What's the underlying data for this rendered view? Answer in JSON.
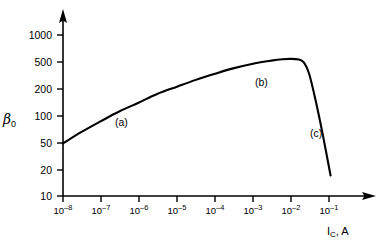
{
  "chart_data": {
    "type": "line",
    "title": "",
    "xlabel": "I_C, A",
    "xlabel_main": "I",
    "xlabel_sub": "C",
    "xlabel_suffix": ", A",
    "ylabel": "β₀",
    "ylabel_main": "β",
    "ylabel_sub": "0",
    "xscale": "log",
    "yscale": "log",
    "xlim": [
      1e-08,
      0.2
    ],
    "ylim": [
      10,
      2000
    ],
    "grid": false,
    "legend": "none",
    "xticks": [
      {
        "value": 1e-08,
        "label_base": "10",
        "label_exp": "–8"
      },
      {
        "value": 1e-07,
        "label_base": "10",
        "label_exp": "–7"
      },
      {
        "value": 1e-06,
        "label_base": "10",
        "label_exp": "–6"
      },
      {
        "value": 1e-05,
        "label_base": "10",
        "label_exp": "–5"
      },
      {
        "value": 0.0001,
        "label_base": "10",
        "label_exp": "–4"
      },
      {
        "value": 0.001,
        "label_base": "10",
        "label_exp": "–3"
      },
      {
        "value": 0.01,
        "label_base": "10",
        "label_exp": "–2"
      },
      {
        "value": 0.1,
        "label_base": "10",
        "label_exp": "–1"
      }
    ],
    "yticks": [
      {
        "value": 1000,
        "label": "1000"
      },
      {
        "value": 500,
        "label": "500"
      },
      {
        "value": 200,
        "label": "200"
      },
      {
        "value": 100,
        "label": "100"
      },
      {
        "value": 50,
        "label": "50"
      },
      {
        "value": 20,
        "label": "20"
      },
      {
        "value": 10,
        "label": "10"
      }
    ],
    "annotations": [
      {
        "text": "(a)",
        "x": 2.5e-06,
        "y": 130,
        "region": "low-current-recombination"
      },
      {
        "text": "(b)",
        "x": 0.0012,
        "y": 380,
        "region": "mid-current-plateau"
      },
      {
        "text": "(c)",
        "x": 0.035,
        "y": 110,
        "region": "high-current-rolloff"
      }
    ],
    "series": [
      {
        "name": "beta0 vs Ic",
        "color": "#000000",
        "points": [
          {
            "x": 1e-08,
            "y": 45
          },
          {
            "x": 3e-08,
            "y": 62
          },
          {
            "x": 1e-07,
            "y": 85
          },
          {
            "x": 3e-07,
            "y": 112
          },
          {
            "x": 1e-06,
            "y": 145
          },
          {
            "x": 3e-06,
            "y": 185
          },
          {
            "x": 1e-05,
            "y": 228
          },
          {
            "x": 3e-05,
            "y": 275
          },
          {
            "x": 0.0001,
            "y": 330
          },
          {
            "x": 0.0003,
            "y": 385
          },
          {
            "x": 0.001,
            "y": 440
          },
          {
            "x": 0.003,
            "y": 480
          },
          {
            "x": 0.006,
            "y": 500
          },
          {
            "x": 0.01,
            "y": 505
          },
          {
            "x": 0.016,
            "y": 495
          },
          {
            "x": 0.022,
            "y": 455
          },
          {
            "x": 0.03,
            "y": 330
          },
          {
            "x": 0.045,
            "y": 150
          },
          {
            "x": 0.07,
            "y": 55
          },
          {
            "x": 0.11,
            "y": 18
          }
        ]
      }
    ]
  },
  "axes": {
    "x_arrow": "arrow-right",
    "y_arrow": "arrow-up"
  }
}
